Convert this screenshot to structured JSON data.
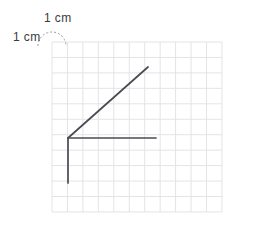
{
  "figure": {
    "labels": {
      "top": "1 cm",
      "left": "1 cm"
    },
    "grid": {
      "unit_label": "1 cm",
      "origin_x": 52,
      "origin_y": 42,
      "cell_size": 15.45,
      "columns": 11,
      "rows": 11,
      "line_color": "#e3e4e8",
      "background": "#ffffff"
    },
    "arc": {
      "name": "unit-cell-indicator",
      "color": "#9a9a9a",
      "dash": "2 2",
      "center_x": 52,
      "center_y": 42,
      "radius": 14
    },
    "drawing": {
      "stroke_color": "#4a4a52",
      "stroke_width": 1.7,
      "vertex": {
        "x": 68,
        "y": 138
      },
      "rays": [
        {
          "name": "vertical-ray-down",
          "x1": 68,
          "y1": 138,
          "x2": 68,
          "y2": 183,
          "length_cm": 3,
          "direction": "down"
        },
        {
          "name": "horizontal-ray-right",
          "x1": 68,
          "y1": 138,
          "x2": 156,
          "y2": 138,
          "length_cm": 5.7,
          "direction": "right"
        },
        {
          "name": "diagonal-ray-up-right",
          "x1": 68,
          "y1": 138,
          "x2": 148,
          "y2": 67,
          "length_cm": 6.9,
          "direction": "up-right",
          "angle_degrees": 42
        }
      ]
    }
  }
}
